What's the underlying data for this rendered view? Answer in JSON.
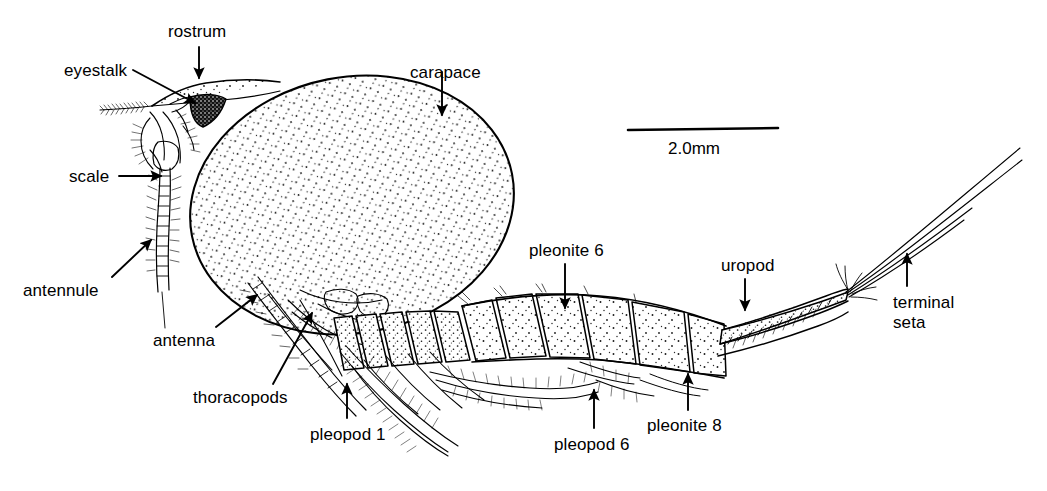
{
  "figure": {
    "kind": "scientific-line-drawing",
    "background_color": "#ffffff",
    "ink_color": "#000000",
    "width": 1047,
    "height": 491
  },
  "scale_bar": {
    "label": "2.0mm",
    "bar_x1": 628,
    "bar_x2": 778,
    "bar_y": 130,
    "text_x": 668,
    "text_y": 139
  },
  "labels": [
    {
      "id": "rostrum",
      "text": "rostrum",
      "x": 168,
      "y": 22,
      "anchor": "start"
    },
    {
      "id": "eyestalk",
      "text": "eyestalk",
      "x": 64,
      "y": 61,
      "anchor": "start"
    },
    {
      "id": "carapace",
      "text": "carapace",
      "x": 410,
      "y": 63,
      "anchor": "start"
    },
    {
      "id": "scale",
      "text": "scale",
      "x": 69,
      "y": 167,
      "anchor": "start"
    },
    {
      "id": "antennule",
      "text": "antennule",
      "x": 23,
      "y": 281,
      "anchor": "start"
    },
    {
      "id": "antenna",
      "text": "antenna",
      "x": 153,
      "y": 331,
      "anchor": "start"
    },
    {
      "id": "thoracopods",
      "text": "thoracopods",
      "x": 193,
      "y": 388,
      "anchor": "start"
    },
    {
      "id": "pleopod-1",
      "text": "pleopod 1",
      "x": 310,
      "y": 425,
      "anchor": "start"
    },
    {
      "id": "pleonite-6",
      "text": "pleonite 6",
      "x": 529,
      "y": 241,
      "anchor": "start"
    },
    {
      "id": "pleopod-6",
      "text": "pleopod 6",
      "x": 554,
      "y": 435,
      "anchor": "start"
    },
    {
      "id": "pleonite-8",
      "text": "pleonite 8",
      "x": 647,
      "y": 416,
      "anchor": "start"
    },
    {
      "id": "uropod",
      "text": "uropod",
      "x": 721,
      "y": 256,
      "anchor": "start"
    },
    {
      "id": "terminal-seta-line1",
      "text": "terminal",
      "x": 893,
      "y": 293,
      "anchor": "start"
    },
    {
      "id": "terminal-seta-line2",
      "text": "seta",
      "x": 893,
      "y": 313,
      "anchor": "start"
    }
  ],
  "leaders": [
    {
      "id": "rostrum-arrow",
      "kind": "arrow-down",
      "x1": 199,
      "y1": 47,
      "x2": 199,
      "y2": 80
    },
    {
      "id": "eyestalk-arrow",
      "kind": "arrow-diagonal",
      "x1": 132,
      "y1": 70,
      "x2": 196,
      "y2": 104
    },
    {
      "id": "carapace-arrow",
      "kind": "arrow-down",
      "x1": 442,
      "y1": 72,
      "x2": 442,
      "y2": 117
    },
    {
      "id": "scale-arrow",
      "kind": "arrow-right",
      "x1": 118,
      "y1": 176,
      "x2": 163,
      "y2": 176
    },
    {
      "id": "antennule-arrow",
      "kind": "arrow-diagonal-up",
      "x1": 110,
      "y1": 277,
      "x2": 152,
      "y2": 238
    },
    {
      "id": "antenna-arrow",
      "kind": "arrow-diagonal-up",
      "x1": 215,
      "y1": 327,
      "x2": 258,
      "y2": 293
    },
    {
      "id": "thoracopods-arrow",
      "kind": "arrow-diagonal-up",
      "x1": 272,
      "y1": 384,
      "x2": 313,
      "y2": 310
    },
    {
      "id": "pleopod-1-arrow",
      "kind": "arrow-up",
      "x1": 347,
      "y1": 418,
      "x2": 347,
      "y2": 382
    },
    {
      "id": "pleonite-6-arrow",
      "kind": "arrow-down",
      "x1": 565,
      "y1": 264,
      "x2": 565,
      "y2": 310
    },
    {
      "id": "pleopod-6-arrow",
      "kind": "arrow-up",
      "x1": 594,
      "y1": 428,
      "x2": 594,
      "y2": 388
    },
    {
      "id": "pleonite-8-arrow",
      "kind": "arrow-up",
      "x1": 688,
      "y1": 410,
      "x2": 688,
      "y2": 372
    },
    {
      "id": "uropod-arrow",
      "kind": "arrow-down",
      "x1": 745,
      "y1": 279,
      "x2": 745,
      "y2": 312
    },
    {
      "id": "terminal-seta-arrow",
      "kind": "arrow-up",
      "x1": 907,
      "y1": 286,
      "x2": 907,
      "y2": 252
    }
  ],
  "anatomy_parts": [
    "rostrum",
    "eyestalk",
    "carapace",
    "scale",
    "antennule",
    "antenna",
    "thoracopods",
    "pleopod 1",
    "pleonite 6",
    "pleopod 6",
    "pleonite 8",
    "uropod",
    "terminal seta"
  ]
}
